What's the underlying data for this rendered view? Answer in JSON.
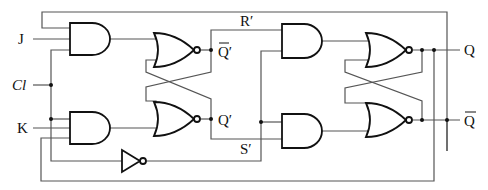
{
  "diagram": {
    "inputs": {
      "j": "J",
      "cl": "Cl",
      "k": "K"
    },
    "internal": {
      "q_bar_prime": "Q′",
      "q_prime": "Q′",
      "r_prime": "R′",
      "s_prime": "S′"
    },
    "outputs": {
      "q": "Q",
      "q_bar": "Q"
    },
    "gates": [
      {
        "id": "and-j",
        "type": "AND",
        "stage": "master"
      },
      {
        "id": "and-k",
        "type": "AND",
        "stage": "master"
      },
      {
        "id": "nor-master-top",
        "type": "NOR",
        "stage": "master"
      },
      {
        "id": "nor-master-bottom",
        "type": "NOR",
        "stage": "master"
      },
      {
        "id": "not-clock",
        "type": "NOT",
        "stage": "clock"
      },
      {
        "id": "and-r",
        "type": "AND",
        "stage": "slave"
      },
      {
        "id": "and-s",
        "type": "AND",
        "stage": "slave"
      },
      {
        "id": "nor-slave-top",
        "type": "NOR",
        "stage": "slave"
      },
      {
        "id": "nor-slave-bottom",
        "type": "NOR",
        "stage": "slave"
      }
    ],
    "colors": {
      "gate_stroke": "#111111",
      "wire": "#555555",
      "background": "#ffffff"
    }
  }
}
